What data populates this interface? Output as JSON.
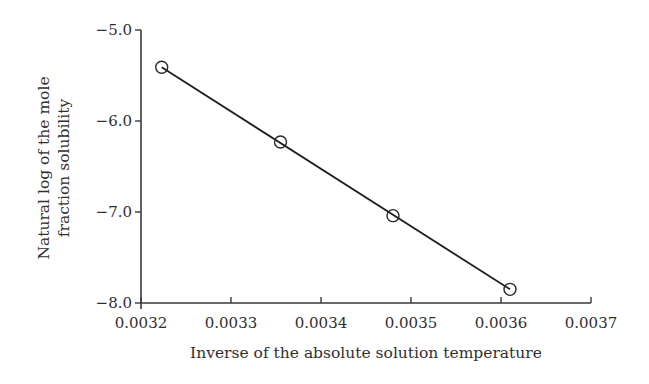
{
  "chart_data": {
    "type": "scatter",
    "title": "",
    "xlabel": "Inverse of the absolute solution temperature",
    "ylabel_lines": [
      "Natural log of the mole",
      "fraction solubility"
    ],
    "ylabel": "Natural log of the mole fraction solubility",
    "xlim": [
      0.0032,
      0.0037
    ],
    "ylim": [
      -8.0,
      -5.0
    ],
    "x_ticks": [
      "0.0032",
      "0.0033",
      "0.0034",
      "0.0035",
      "0.0036",
      "0.0037"
    ],
    "y_ticks": [
      "-5.0",
      "-6.0",
      "-7.0",
      "-8.0"
    ],
    "y_tick_labels": [
      "−5.0",
      "−6.0",
      "−7.0",
      "−8.0"
    ],
    "grid": false,
    "legend": null,
    "series": [
      {
        "name": "data",
        "marker": "open-circle",
        "x": [
          0.003223,
          0.003355,
          0.00348,
          0.00361
        ],
        "y": [
          -5.41,
          -6.23,
          -7.04,
          -7.85
        ]
      }
    ],
    "fit_line": {
      "x": [
        0.003223,
        0.00361
      ],
      "y": [
        -5.41,
        -7.85
      ]
    }
  }
}
